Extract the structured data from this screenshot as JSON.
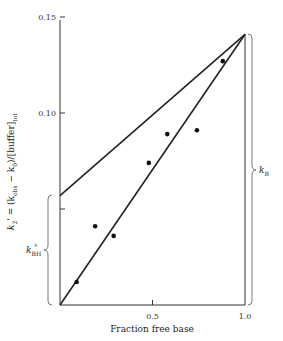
{
  "chart_data": {
    "type": "scatter",
    "title": "",
    "xlabel": "Fraction free base",
    "ylabel": "k2' = (k_obs − k0)/[buffer]_tot",
    "xlim": [
      0,
      1.0
    ],
    "ylim": [
      0,
      0.15
    ],
    "x_ticks": [
      {
        "value": 0.5,
        "label": "0.5"
      },
      {
        "value": 1.0,
        "label": "1.0"
      }
    ],
    "y_ticks": [
      {
        "value": 0.15,
        "label": "0.15"
      },
      {
        "value": 0.1,
        "label": "0.10"
      },
      {
        "value": 0.05,
        "label": ""
      }
    ],
    "grid": false,
    "legend": null,
    "series": [
      {
        "name": "Observed points",
        "type": "scatter",
        "x": [
          0.09,
          0.19,
          0.29,
          0.48,
          0.58,
          0.74,
          0.88
        ],
        "y": [
          0.012,
          0.041,
          0.036,
          0.074,
          0.089,
          0.091,
          0.127
        ]
      },
      {
        "name": "Lower line (through origin)",
        "type": "line",
        "x": [
          0.0,
          1.0
        ],
        "y": [
          0.0,
          0.141
        ]
      },
      {
        "name": "Upper line",
        "type": "line",
        "x": [
          0.0,
          1.0
        ],
        "y": [
          0.057,
          0.141
        ]
      }
    ],
    "annotations": [
      {
        "text": "k_BH+",
        "type": "bracket",
        "side": "left",
        "y_range": [
          0.0,
          0.057
        ]
      },
      {
        "text": "k_B",
        "type": "bracket",
        "side": "right",
        "y_range": [
          0.0,
          0.141
        ]
      }
    ]
  },
  "labels": {
    "xlabel": "Fraction free base",
    "ylabel_main": "k",
    "ylabel_sub": "2",
    "ylabel_rest": "' = (k",
    "ylabel_obs": "obs",
    "ylabel_mid": " − k",
    "ylabel_zero": "0",
    "ylabel_end": ")/[buffer]",
    "ylabel_tot": "tot",
    "bracket_left_main": "k",
    "bracket_left_sub": "BH",
    "bracket_left_sup": "+",
    "bracket_right_main": "k",
    "bracket_right_sub": "B"
  }
}
